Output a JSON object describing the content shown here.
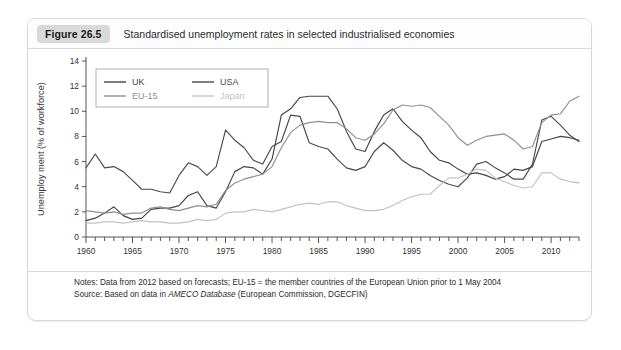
{
  "figure": {
    "badge": "Figure 26.5",
    "title": "Standardised unemployment rates in selected industrialised economies"
  },
  "footer": {
    "notes_label": "Notes:",
    "notes_text": " Data from 2012 based on forecasts; EU-15 = the member countries of the European Union prior to 1 May 2004",
    "source_label": "Source:",
    "source_pre": " Based on data in ",
    "source_italic": "AMECO Database",
    "source_post": " (European Commission, DGECFIN)"
  },
  "chart_data": {
    "type": "line",
    "title": "Standardised unemployment rates in selected industrialised economies",
    "xlabel": "",
    "ylabel": "Unemploy ment (% of workforce)",
    "xlim": [
      1960,
      2013
    ],
    "ylim": [
      0,
      14
    ],
    "yticks": [
      0,
      2,
      4,
      6,
      8,
      10,
      12,
      14
    ],
    "xticks": [
      1960,
      1965,
      1970,
      1975,
      1980,
      1985,
      1990,
      1995,
      2000,
      2005,
      2010
    ],
    "xtick_minor_step": 1,
    "grid": false,
    "legend_position": "top-left",
    "x": [
      1960,
      1961,
      1962,
      1963,
      1964,
      1965,
      1966,
      1967,
      1968,
      1969,
      1970,
      1971,
      1972,
      1973,
      1974,
      1975,
      1976,
      1977,
      1978,
      1979,
      1980,
      1981,
      1982,
      1983,
      1984,
      1985,
      1986,
      1987,
      1988,
      1989,
      1990,
      1991,
      1992,
      1993,
      1994,
      1995,
      1996,
      1997,
      1998,
      1999,
      2000,
      2001,
      2002,
      2003,
      2004,
      2005,
      2006,
      2007,
      2008,
      2009,
      2010,
      2011,
      2012,
      2013
    ],
    "series": [
      {
        "name": "UK",
        "color": "#444444",
        "values": [
          1.3,
          1.5,
          1.9,
          2.4,
          1.7,
          1.4,
          1.5,
          2.2,
          2.3,
          2.3,
          2.5,
          3.3,
          3.6,
          2.5,
          2.3,
          3.6,
          5.2,
          5.6,
          5.5,
          5.0,
          6.2,
          9.7,
          10.2,
          11.1,
          11.2,
          11.2,
          11.2,
          10.2,
          8.4,
          7.0,
          6.8,
          8.4,
          9.7,
          10.2,
          9.2,
          8.5,
          7.9,
          6.8,
          6.1,
          5.9,
          5.4,
          5.0,
          5.1,
          4.9,
          4.6,
          4.8,
          5.4,
          5.3,
          5.6,
          7.6,
          7.8,
          8.0,
          7.9,
          7.7
        ]
      },
      {
        "name": "USA",
        "color": "#4a4a4a",
        "values": [
          5.5,
          6.6,
          5.5,
          5.6,
          5.2,
          4.5,
          3.8,
          3.8,
          3.6,
          3.5,
          4.9,
          5.9,
          5.6,
          4.9,
          5.6,
          8.5,
          7.7,
          7.1,
          6.1,
          5.8,
          7.2,
          7.6,
          9.7,
          9.6,
          7.5,
          7.2,
          7.0,
          6.2,
          5.5,
          5.3,
          5.6,
          6.8,
          7.5,
          6.9,
          6.1,
          5.6,
          5.4,
          4.9,
          4.5,
          4.2,
          4.0,
          4.7,
          5.8,
          6.0,
          5.5,
          5.1,
          4.6,
          4.6,
          5.8,
          9.3,
          9.6,
          8.9,
          8.1,
          7.6
        ]
      },
      {
        "name": "EU-15",
        "color": "#8f8f8f",
        "values": [
          2.1,
          2.0,
          1.9,
          2.0,
          1.8,
          1.9,
          1.9,
          2.3,
          2.4,
          2.2,
          2.1,
          2.3,
          2.5,
          2.4,
          2.6,
          3.7,
          4.3,
          4.6,
          4.8,
          5.0,
          5.6,
          7.1,
          8.3,
          8.9,
          9.1,
          9.2,
          9.1,
          9.1,
          8.6,
          7.9,
          7.7,
          8.2,
          9.0,
          10.1,
          10.5,
          10.4,
          10.5,
          10.3,
          9.6,
          8.9,
          7.9,
          7.3,
          7.7,
          8.0,
          8.1,
          8.2,
          7.7,
          7.0,
          7.2,
          9.1,
          9.7,
          9.8,
          10.8,
          11.2
        ]
      },
      {
        "name": "Japan",
        "color": "#c2c2c2",
        "values": [
          1.1,
          1.1,
          1.2,
          1.2,
          1.1,
          1.2,
          1.3,
          1.2,
          1.2,
          1.1,
          1.1,
          1.2,
          1.4,
          1.3,
          1.4,
          1.9,
          2.0,
          2.0,
          2.2,
          2.1,
          2.0,
          2.2,
          2.4,
          2.6,
          2.7,
          2.6,
          2.8,
          2.8,
          2.5,
          2.3,
          2.1,
          2.1,
          2.2,
          2.5,
          2.9,
          3.2,
          3.4,
          3.4,
          4.1,
          4.7,
          4.7,
          5.0,
          5.4,
          5.3,
          4.7,
          4.4,
          4.1,
          3.9,
          4.0,
          5.1,
          5.1,
          4.6,
          4.4,
          4.3
        ]
      }
    ],
    "legend": [
      {
        "name": "UK",
        "color": "#444444"
      },
      {
        "name": "USA",
        "color": "#4a4a4a"
      },
      {
        "name": "EU-15",
        "color": "#8f8f8f"
      },
      {
        "name": "Japan",
        "color": "#c2c2c2"
      }
    ]
  }
}
